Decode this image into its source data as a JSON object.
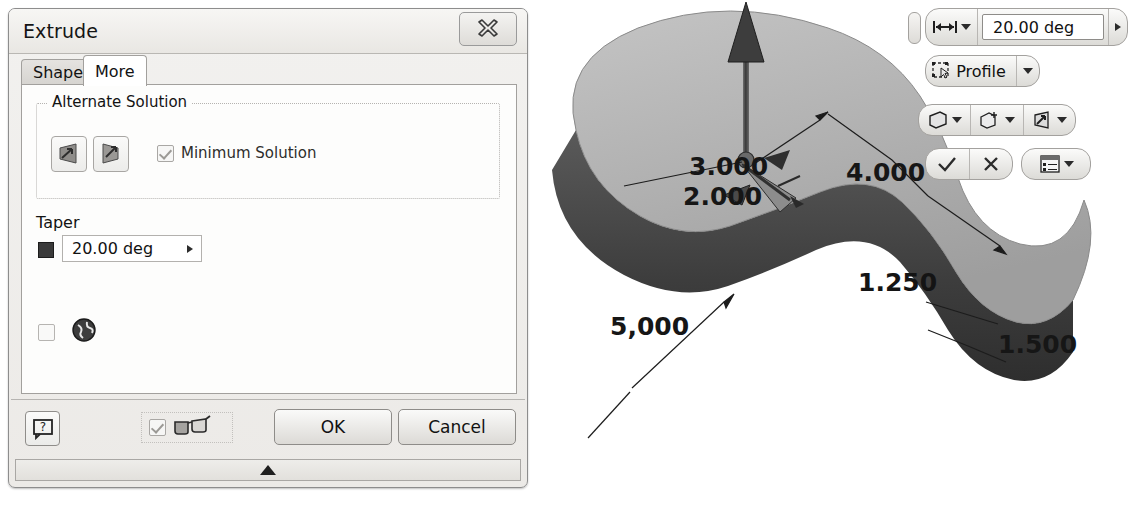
{
  "dialog": {
    "title": "Extrude",
    "close_icon": "close-x-icon",
    "tabs": [
      {
        "label": "Shape",
        "active": false
      },
      {
        "label": "More",
        "active": true
      }
    ],
    "alternate_solution": {
      "group_label": "Alternate Solution",
      "buttons": [
        {
          "icon": "taper-outward-icon"
        },
        {
          "icon": "taper-inward-icon"
        }
      ],
      "checkbox": {
        "label": "Minimum Solution",
        "checked": true,
        "enabled": false
      }
    },
    "taper": {
      "label": "Taper",
      "swatch_icon": "angle-swatch-icon",
      "value": "20.00 deg",
      "arrow_icon": "chevron-right-icon"
    },
    "extra_option": {
      "checkbox_checked": false,
      "icon": "globe-icon"
    },
    "footer": {
      "help_icon": "help-question-icon",
      "preview": {
        "checked": true,
        "icon": "glasses-preview-icon"
      },
      "ok_label": "OK",
      "cancel_label": "Cancel"
    },
    "statusbar": {
      "expand_icon": "triangle-up-icon"
    }
  },
  "minitoolbar": {
    "grip_icon": "drag-grip-icon",
    "row1": {
      "measure_icon": "distance-between-icon",
      "dropdown_icon": "chevron-down-icon",
      "value": "20.00 deg",
      "next_icon": "chevron-right-icon"
    },
    "row2": {
      "select_icon": "select-profile-icon",
      "label": "Profile",
      "dropdown_icon": "chevron-down-icon"
    },
    "row3": [
      {
        "icon": "solid-body-icon",
        "dropdown_icon": "chevron-down-icon"
      },
      {
        "icon": "new-solid-boolean-icon",
        "dropdown_icon": "chevron-down-icon"
      },
      {
        "icon": "taper-direction-icon",
        "dropdown_icon": "chevron-down-icon"
      }
    ],
    "row4": {
      "ok_icon": "checkmark-icon",
      "cancel_icon": "cross-icon",
      "options_icon": "options-list-icon",
      "options_dropdown_icon": "chevron-down-icon"
    }
  },
  "viewport": {
    "model_name": "extruded-peanut-solid",
    "manipulator_icon": "extrude-direction-arrow",
    "dimensions": [
      {
        "name": "dim-3000",
        "value": "3.000"
      },
      {
        "name": "dim-2000",
        "value": "2.000"
      },
      {
        "name": "dim-4000",
        "value": "4.000"
      },
      {
        "name": "dim-1250",
        "value": "1.250"
      },
      {
        "name": "dim-1500",
        "value": "1.500"
      },
      {
        "name": "dim-5000",
        "value": "5,000"
      }
    ]
  }
}
